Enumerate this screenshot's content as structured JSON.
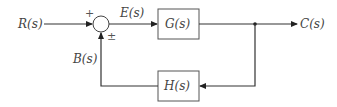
{
  "diagram": {
    "type": "feedback-control-block-diagram",
    "input_label": "R(s)",
    "error_label": "E(s)",
    "output_label": "C(s)",
    "feedback_label": "B(s)",
    "forward_block": "G(s)",
    "feedback_block": "H(s)",
    "summing_junction": {
      "top_sign": "+",
      "bottom_sign": "±"
    }
  },
  "colors": {
    "line": "#333333",
    "text": "#444444",
    "background": "#ffffff"
  }
}
